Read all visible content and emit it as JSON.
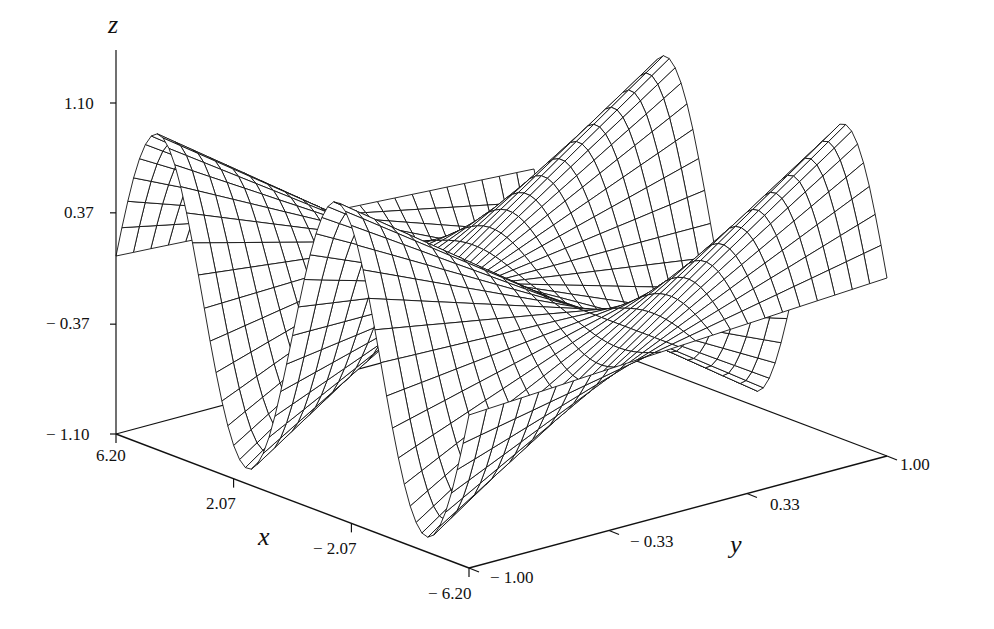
{
  "chart_data": {
    "type": "surface3d",
    "title": "",
    "function": "z = y * sin(x)",
    "xlabel": "x",
    "ylabel": "y",
    "zlabel": "z",
    "xlim": [
      -6.2,
      6.2
    ],
    "ylim": [
      -1.0,
      1.0
    ],
    "zlim": [
      -1.1,
      1.1
    ],
    "x_ticks": [
      "6.20",
      "2.07",
      "− 2.07",
      "− 6.20"
    ],
    "x_tick_values": [
      6.2,
      2.07,
      -2.07,
      -6.2
    ],
    "y_ticks": [
      "− 1.00",
      "− 0.33",
      "0.33",
      "1.00"
    ],
    "y_tick_values": [
      -1.0,
      -0.33,
      0.33,
      1.0
    ],
    "z_ticks": [
      "1.10",
      "0.37",
      "− 0.37",
      "− 1.10"
    ],
    "z_tick_values": [
      1.1,
      0.37,
      -0.37,
      -1.1
    ],
    "grid": {
      "x_lines": 60,
      "y_lines": 24
    },
    "style": {
      "mesh": "wireframe-hidden-line",
      "line_color": "#111111",
      "face_color": "#ffffff"
    },
    "grid_lines": false,
    "legend": null
  },
  "labels": {
    "z_axis": "z",
    "x_axis": "x",
    "y_axis": "y"
  }
}
